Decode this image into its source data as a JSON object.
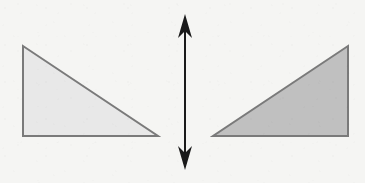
{
  "canvas": {
    "width": 365,
    "height": 183,
    "background_color": "#f5f5f3"
  },
  "style": {
    "stroke_color": "#7a7a7a",
    "stroke_width": 2,
    "arrow_color": "#1a1a1a",
    "left_fill_color": "#e8e8e8",
    "right_fill_color": "#c0c0c0"
  },
  "shapes": {
    "left_triangle": {
      "label": "left-right-triangle",
      "fill_color": "#e8e8e8",
      "stroke_color": "#7a7a7a",
      "right_angle_corner": "bottom-left",
      "points": "23,46 23,136 158,136",
      "vertices": [
        {
          "name": "apex",
          "x": 23,
          "y": 46
        },
        {
          "name": "bottom-left",
          "x": 23,
          "y": 136
        },
        {
          "name": "bottom-right",
          "x": 158,
          "y": 136
        }
      ]
    },
    "right_triangle": {
      "label": "right-right-triangle",
      "fill_color": "#c0c0c0",
      "stroke_color": "#7a7a7a",
      "right_angle_corner": "bottom-right",
      "points": "348,46 348,136 213,136",
      "vertices": [
        {
          "name": "apex",
          "x": 348,
          "y": 46
        },
        {
          "name": "bottom-right",
          "x": 348,
          "y": 136
        },
        {
          "name": "bottom-left",
          "x": 213,
          "y": 136
        }
      ]
    }
  },
  "arrow": {
    "label": "vertical-double-headed-arrow",
    "orientation": "vertical",
    "color": "#1a1a1a",
    "shaft_x": 185,
    "top_y": 14,
    "bottom_y": 170,
    "shaft_width": 2,
    "head_half_width": 7,
    "head_length": 24,
    "head_notch": 7,
    "top_head_points": "185,14 192,38 185,31 178,38",
    "bottom_head_points": "185,170 178,146 185,153 192,146"
  }
}
